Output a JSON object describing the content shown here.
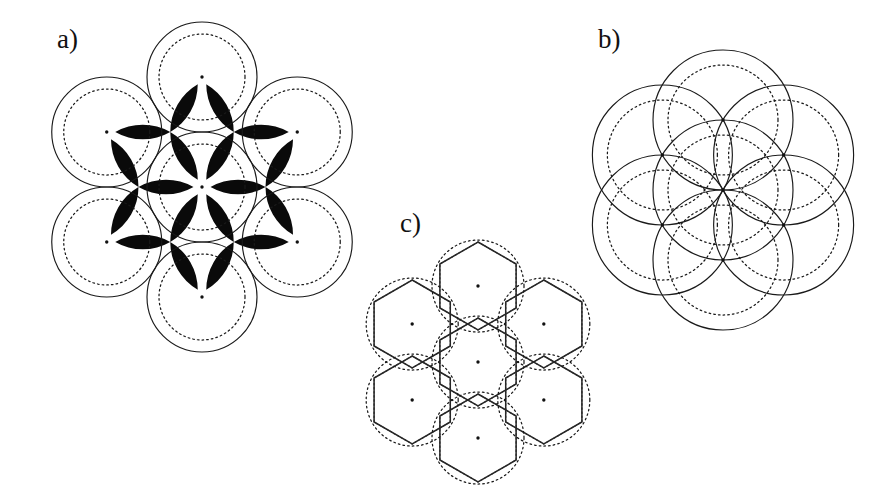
{
  "figure": {
    "background_color": "#ffffff",
    "ink_color": "#111111",
    "interstice_fill": "#0a0a0a",
    "width": 875,
    "height": 499
  },
  "panels": [
    {
      "id": "a",
      "label": "a)",
      "label_x": 57,
      "label_y": 48,
      "description": "Hexagonal close packing of seven tangent circles with dashed inner circles and filled black interstitial curvilinear triangles",
      "center_x": 202,
      "center_y": 187,
      "spacing": 110,
      "outer_radius": 55,
      "inner_radius": 43,
      "dot_radius": 1.7,
      "circle_count": 7,
      "has_solid_outline": true,
      "has_dashed_inner": true,
      "has_interstices": true,
      "has_hexagons": false,
      "neighbor_angles_deg": [
        60,
        120,
        180,
        240,
        300,
        360
      ],
      "interstice_angles_deg": [
        30,
        90,
        150,
        210,
        270,
        330
      ]
    },
    {
      "id": "b",
      "label": "b)",
      "label_x": 598,
      "label_y": 48,
      "description": "Seven overlapping circles on a hexagonal lattice where the circle radius equals the lattice spacing",
      "center_x": 723,
      "center_y": 190,
      "spacing": 70,
      "outer_radius": 70,
      "inner_radius": 55,
      "dot_radius": 1.7,
      "circle_count": 7,
      "has_solid_outline": true,
      "has_dashed_inner": true,
      "has_interstices": false,
      "has_hexagons": false,
      "neighbor_angles_deg": [
        60,
        120,
        180,
        240,
        300,
        360
      ],
      "interstice_angles_deg": []
    },
    {
      "id": "c",
      "label": "c)",
      "label_x": 400,
      "label_y": 232,
      "description": "Voronoi honeycomb tessellation of seven dashed circles with solid hexagonal cell boundaries",
      "center_x": 478,
      "center_y": 362,
      "spacing": 76,
      "outer_radius": 46,
      "inner_radius": 46,
      "dot_radius": 1.7,
      "circle_count": 7,
      "has_solid_outline": false,
      "has_dashed_inner": true,
      "has_interstices": false,
      "has_hexagons": true,
      "hex_circumradius": 44,
      "hex_rotation_deg": 0,
      "neighbor_angles_deg": [
        60,
        120,
        180,
        240,
        300,
        360
      ],
      "interstice_angles_deg": []
    }
  ],
  "chart_data": {
    "type": "diagram",
    "panel_ids": [
      "a",
      "b",
      "c"
    ],
    "panel_labels": [
      "a)",
      "b)",
      "c)"
    ],
    "lattice": "hexagonal",
    "sites_per_panel": 7,
    "panel_notes": [
      "a) tangent circles, radius = half lattice spacing, black interstices",
      "b) overlapping circles, radius = lattice spacing",
      "c) hexagonal Voronoi cells inscribed in dashed circles"
    ]
  }
}
